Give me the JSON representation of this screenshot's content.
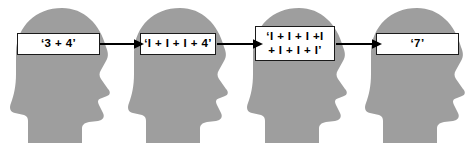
{
  "figure": {
    "type": "process-flow-diagram",
    "background_color": "#ffffff",
    "head_fill_color": "#9e9e9e",
    "box_fill_color": "#ffffff",
    "box_border_color": "#1a1a1a",
    "arrow_color": "#000000",
    "text_color": "#000000"
  },
  "steps": [
    {
      "id": "step-1",
      "icon": "head-profile-icon",
      "box_lines": [
        "‘3 + 4’"
      ],
      "line1": "‘3 + 4’",
      "line2": ""
    },
    {
      "id": "step-2",
      "icon": "head-profile-icon",
      "box_lines": [
        "‘I + I + I + 4’"
      ],
      "line1": "‘I + I + I + 4’",
      "line2": ""
    },
    {
      "id": "step-3",
      "icon": "head-profile-icon",
      "box_lines": [
        "‘I + I + I +I",
        "+ I + I + I’"
      ],
      "line1": "‘I + I + I +I",
      "line2": "+ I + I + I’"
    },
    {
      "id": "step-4",
      "icon": "head-profile-icon",
      "box_lines": [
        "‘7’"
      ],
      "line1": "‘7’",
      "line2": ""
    }
  ],
  "connectors": [
    {
      "id": "arrow-1",
      "icon": "arrow-right-icon",
      "from": "step-1",
      "to": "step-2"
    },
    {
      "id": "arrow-2",
      "icon": "arrow-right-icon",
      "from": "step-2",
      "to": "step-3"
    },
    {
      "id": "arrow-3",
      "icon": "arrow-right-icon",
      "from": "step-3",
      "to": "step-4"
    }
  ]
}
